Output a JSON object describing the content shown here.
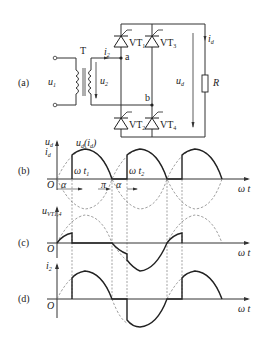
{
  "panels": {
    "a": {
      "label": "(a)"
    },
    "b": {
      "label": "(b)"
    },
    "c": {
      "label": "(c)"
    },
    "d": {
      "label": "(d)"
    }
  },
  "circuit": {
    "transformer": "T",
    "primary_voltage": "u",
    "primary_sub": "1",
    "secondary_voltage": "u",
    "secondary_sub": "2",
    "secondary_current": "i",
    "secondary_current_sub": "2",
    "node_a": "a",
    "node_b": "b",
    "thyristors": [
      {
        "name": "VT",
        "sub": "1"
      },
      {
        "name": "VT",
        "sub": "3"
      },
      {
        "name": "VT",
        "sub": "2"
      },
      {
        "name": "VT",
        "sub": "4"
      }
    ],
    "load_voltage": "u",
    "load_voltage_sub": "d",
    "load_current": "i",
    "load_current_sub": "d",
    "resistor": "R"
  },
  "waveforms": {
    "b": {
      "ylabel_top": "u",
      "ylabel_top_sub": "d",
      "ylabel_bottom": "i",
      "ylabel_bottom_sub": "d",
      "curve_label": "u",
      "curve_label_sub": "d",
      "curve_label_paren": "(i",
      "curve_label_paren_sub": "d",
      "curve_label_close": ")",
      "origin": "O",
      "alpha": "α",
      "pi": "π",
      "wt1": "ω t",
      "wt1_sub": "1",
      "wt2": "ω t",
      "wt2_sub": "2",
      "xlabel": "ω t"
    },
    "c": {
      "ylabel": "u",
      "ylabel_sub": "VT1,4",
      "origin": "O",
      "xlabel": "ω t"
    },
    "d": {
      "ylabel": "i",
      "ylabel_sub": "2",
      "origin": "O",
      "xlabel": "ω t"
    }
  }
}
